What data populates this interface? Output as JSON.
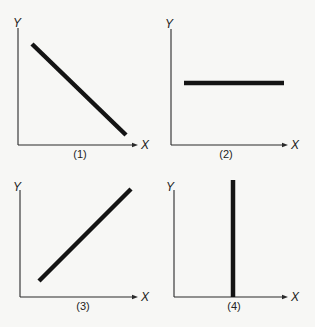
{
  "figure": {
    "background": "#f7f7f5",
    "line_color": "#141414",
    "panels": [
      {
        "id": "1",
        "label": "(1)",
        "x_axis_label": "X",
        "y_axis_label": "Y",
        "relationship": "negative linear (downward sloping)",
        "axis": {
          "origin": [
            18,
            145
          ],
          "y_top": 28,
          "x_end": 138
        },
        "label_pos": {
          "x": [
            141,
            149
          ],
          "y": [
            17,
            23
          ],
          "panel": [
            80,
            158
          ]
        },
        "line": {
          "x1": 32,
          "y1": 44,
          "x2": 126,
          "y2": 135
        }
      },
      {
        "id": "2",
        "label": "(2)",
        "x_axis_label": "X",
        "y_axis_label": "Y",
        "relationship": "horizontal line (Y constant)",
        "axis": {
          "origin": [
            171,
            145
          ],
          "y_top": 29,
          "x_end": 288
        },
        "label_pos": {
          "x": [
            291,
            149
          ],
          "y": [
            169,
            24
          ],
          "panel": [
            226,
            158
          ]
        },
        "line": {
          "x1": 184,
          "y1": 83,
          "x2": 284,
          "y2": 83
        }
      },
      {
        "id": "3",
        "label": "(3)",
        "x_axis_label": "X",
        "y_axis_label": "Y",
        "relationship": "positive linear (upward sloping)",
        "axis": {
          "origin": [
            20,
            297
          ],
          "y_top": 190,
          "x_end": 138
        },
        "label_pos": {
          "x": [
            141,
            301
          ],
          "y": [
            17,
            187
          ],
          "panel": [
            83,
            310
          ]
        },
        "line": {
          "x1": 39,
          "y1": 281,
          "x2": 131,
          "y2": 189
        }
      },
      {
        "id": "4",
        "label": "(4)",
        "x_axis_label": "X",
        "y_axis_label": "Y",
        "relationship": "vertical line (X constant)",
        "axis": {
          "origin": [
            174,
            297
          ],
          "y_top": 190,
          "x_end": 288
        },
        "label_pos": {
          "x": [
            291,
            301
          ],
          "y": [
            170,
            187
          ],
          "panel": [
            234,
            310
          ]
        },
        "line": {
          "x1": 233,
          "y1": 180,
          "x2": 233,
          "y2": 297
        }
      }
    ]
  }
}
